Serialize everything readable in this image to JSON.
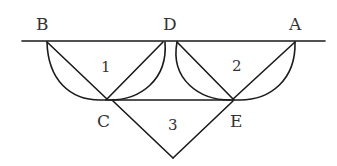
{
  "diagram": {
    "type": "geometry-figure",
    "points": {
      "B": {
        "label": "B",
        "x": 47,
        "y": 41,
        "label_x": 42,
        "label_y": 28
      },
      "D": {
        "label": "D",
        "x": 168,
        "y": 41,
        "label_x": 170,
        "label_y": 28
      },
      "A": {
        "label": "A",
        "x": 295,
        "y": 41,
        "label_x": 295,
        "label_y": 28
      },
      "C": {
        "label": "C",
        "x": 107,
        "y": 100,
        "label_x": 104,
        "label_y": 126
      },
      "E": {
        "label": "E",
        "x": 233,
        "y": 100,
        "label_x": 237,
        "label_y": 126
      }
    },
    "regions": [
      {
        "id": "1",
        "label": "1",
        "x": 106,
        "y": 71
      },
      {
        "id": "2",
        "label": "2",
        "x": 237,
        "y": 70
      },
      {
        "id": "3",
        "label": "3",
        "x": 174,
        "y": 129
      }
    ],
    "colors": {
      "stroke": "#1a1a1a",
      "text": "#333333",
      "background": "#ffffff"
    }
  }
}
